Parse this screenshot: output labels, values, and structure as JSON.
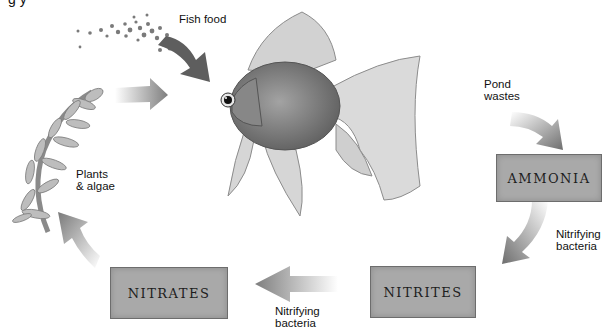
{
  "diagram": {
    "title_fragment": "g   y",
    "nodes": {
      "fish_food": {
        "label": "Fish food"
      },
      "pond_wastes": {
        "label_line1": "Pond",
        "label_line2": "wastes"
      },
      "ammonia": {
        "label": "AMMONIA"
      },
      "nitrites": {
        "label": "NITRITES"
      },
      "nitrates": {
        "label": "NITRATES"
      },
      "plants": {
        "label_line1": "Plants",
        "label_line2": "& algae"
      }
    },
    "edges": [
      {
        "from": "fish",
        "to": "ammonia",
        "label": "Pond wastes"
      },
      {
        "from": "ammonia",
        "to": "nitrites",
        "label_line1": "Nitrifying",
        "label_line2": "bacteria"
      },
      {
        "from": "nitrites",
        "to": "nitrates",
        "label_line1": "Nitrifying",
        "label_line2": "bacteria"
      },
      {
        "from": "nitrates",
        "to": "plants",
        "label": ""
      },
      {
        "from": "plants",
        "to": "fish",
        "label": ""
      },
      {
        "from": "fish_food",
        "to": "fish",
        "label": "Fish food"
      }
    ],
    "colors": {
      "box_fill": "#a9a9a9",
      "box_border": "#6d6d6d",
      "arrow": "#8a8a8a",
      "fish": "#8c8c8c"
    }
  }
}
